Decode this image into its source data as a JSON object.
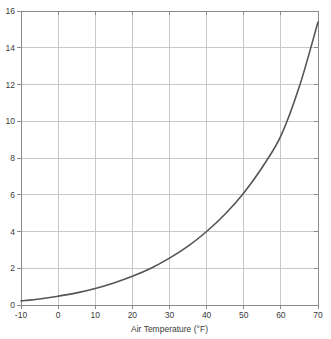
{
  "chart_data": {
    "type": "line",
    "title": "",
    "xlabel": "Air Temperature (°F)",
    "ylabel": "",
    "xlim": [
      -10,
      70
    ],
    "ylim": [
      0,
      16
    ],
    "grid": true,
    "legend": false,
    "xticks": [
      "-10",
      "0",
      "10",
      "20",
      "30",
      "40",
      "50",
      "60",
      "70"
    ],
    "xtick_values": [
      -10,
      0,
      10,
      20,
      30,
      40,
      50,
      60,
      70
    ],
    "yticks": [
      "0",
      "2",
      "4",
      "6",
      "8",
      "10",
      "12",
      "14",
      "16"
    ],
    "ytick_values": [
      0,
      2,
      4,
      6,
      8,
      10,
      12,
      14,
      16
    ],
    "series": [
      {
        "name": "Saturation vapor pressure",
        "color": "#555555",
        "x": [
          -10,
          -5,
          0,
          5,
          10,
          15,
          20,
          25,
          30,
          35,
          40,
          45,
          50,
          55,
          60,
          65,
          70
        ],
        "values": [
          0.22,
          0.33,
          0.48,
          0.66,
          0.9,
          1.2,
          1.56,
          2.0,
          2.55,
          3.2,
          4.0,
          4.95,
          6.1,
          7.5,
          9.2,
          11.9,
          15.4
        ]
      }
    ]
  },
  "axes": {
    "x_title": "Air Temperature (°F)",
    "x_tick_labels": [
      "-10",
      "0",
      "10",
      "20",
      "30",
      "40",
      "50",
      "60",
      "70"
    ],
    "y_tick_labels": [
      "0",
      "2",
      "4",
      "6",
      "8",
      "10",
      "12",
      "14",
      "16"
    ]
  },
  "colors": {
    "curve": "#555555",
    "grid": "#c8c8c8",
    "frame": "#8a8a8a",
    "text": "#3a3a3a",
    "background": "#ffffff"
  }
}
